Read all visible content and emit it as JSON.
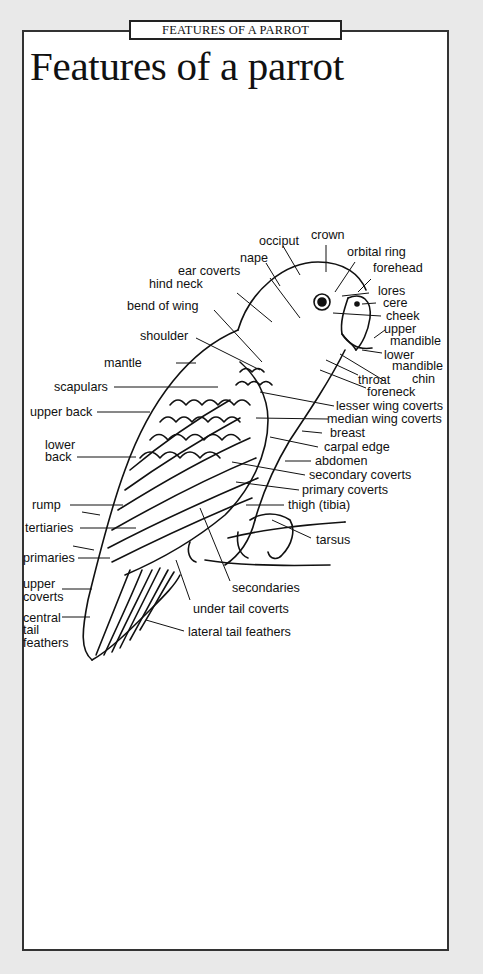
{
  "header": {
    "tab_label": "FEATURES OF A PARROT",
    "title": "Features of a parrot"
  },
  "diagram": {
    "subject": "parrot",
    "labels": {
      "occiput": "occiput",
      "crown": "crown",
      "nape": "nape",
      "orbital_ring": "orbital ring",
      "forehead": "forehead",
      "ear_coverts": "ear coverts",
      "hind_neck": "hind neck",
      "lores": "lores",
      "cere": "cere",
      "cheek": "cheek",
      "bend_of_wing": "bend of wing",
      "upper_mandible_1": "upper",
      "upper_mandible_2": "mandible",
      "shoulder": "shoulder",
      "lower_mandible_1": "lower",
      "lower_mandible_2": "mandible",
      "mantle": "mantle",
      "chin": "chin",
      "throat": "throat",
      "foreneck": "foreneck",
      "scapulars": "scapulars",
      "lesser_wing_coverts": "lesser wing coverts",
      "upper_back": "upper back",
      "median_wing_coverts": "median wing coverts",
      "breast": "breast",
      "lower_back_1": "lower",
      "lower_back_2": "back",
      "carpal_edge": "carpal edge",
      "abdomen": "abdomen",
      "secondary_coverts": "secondary coverts",
      "primary_coverts": "primary coverts",
      "rump": "rump",
      "thigh": "thigh (tibia)",
      "tertiaries": "tertiaries",
      "tarsus": "tarsus",
      "primaries": "primaries",
      "upper_coverts_1": "upper",
      "upper_coverts_2": "coverts",
      "secondaries": "secondaries",
      "central_tail_1": "central",
      "central_tail_2": "tail",
      "central_tail_3": "feathers",
      "under_tail_coverts": "under tail coverts",
      "lateral_tail_feathers": "lateral tail feathers"
    }
  }
}
